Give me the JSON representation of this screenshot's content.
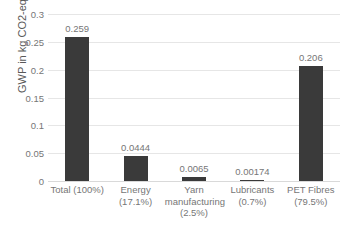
{
  "chart_data": {
    "type": "bar",
    "title": "",
    "xlabel": "",
    "ylabel": "GWP in kg CO2-eq",
    "ylim": [
      0,
      0.3
    ],
    "ytick_labels": [
      "0",
      "0.05",
      "0.1",
      "0.15",
      "0.2",
      "0.25",
      "0.3"
    ],
    "ytick_values": [
      0,
      0.05,
      0.1,
      0.15,
      0.2,
      0.25,
      0.3
    ],
    "grid": true,
    "legend": "none",
    "bar_color": "#3a3a3a",
    "gridline_color": "#e6e6e6",
    "categories": [
      "Total (100%)",
      "Energy (17.1%)",
      "Yarn manufacturing (2.5%)",
      "Lubricants (0.7%)",
      "PET Fibres (79.5%)"
    ],
    "category_lines": [
      [
        "Total (100%)"
      ],
      [
        "Energy",
        "(17.1%)"
      ],
      [
        "Yarn",
        "manufacturing",
        "(2.5%)"
      ],
      [
        "Lubricants",
        "(0.7%)"
      ],
      [
        "PET Fibres",
        "(79.5%)"
      ]
    ],
    "values": [
      0.259,
      0.0444,
      0.0065,
      0.00174,
      0.206
    ],
    "value_labels": [
      "0.259",
      "0.0444",
      "0.0065",
      "0.00174",
      "0.206"
    ]
  }
}
